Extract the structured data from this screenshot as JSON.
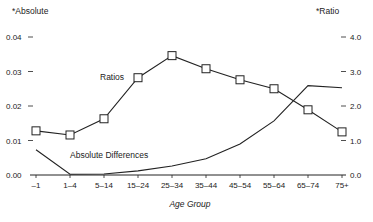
{
  "chart_data": {
    "type": "line",
    "title": "",
    "xlabel": "Age Group",
    "ylabel_left": "*Absolute",
    "ylabel_right": "*Ratio",
    "categories": [
      "–1",
      "1–4",
      "5–14",
      "15–24",
      "25–34",
      "35–44",
      "45–54",
      "55–64",
      "65–74",
      "75+"
    ],
    "left_axis": {
      "ticks": [
        "0.00",
        "0.01",
        "0.02",
        "0.03",
        "0.04"
      ],
      "ylim": [
        0,
        0.04
      ]
    },
    "right_axis": {
      "ticks": [
        "0.0",
        "1.0",
        "2.0",
        "3.0",
        "4.0"
      ],
      "ylim": [
        0,
        4.0
      ]
    },
    "grid": false,
    "legend": "inline labels",
    "series": [
      {
        "name": "Ratios",
        "axis": "right",
        "marker": "square",
        "values": [
          1.28,
          1.16,
          1.63,
          2.82,
          3.46,
          3.08,
          2.76,
          2.5,
          1.89,
          1.25
        ]
      },
      {
        "name": "Absolute Differences",
        "axis": "left",
        "marker": "none",
        "values": [
          0.0073,
          0.0002,
          0.0003,
          0.0012,
          0.0026,
          0.0047,
          0.009,
          0.0157,
          0.0259,
          0.0253
        ]
      }
    ]
  }
}
